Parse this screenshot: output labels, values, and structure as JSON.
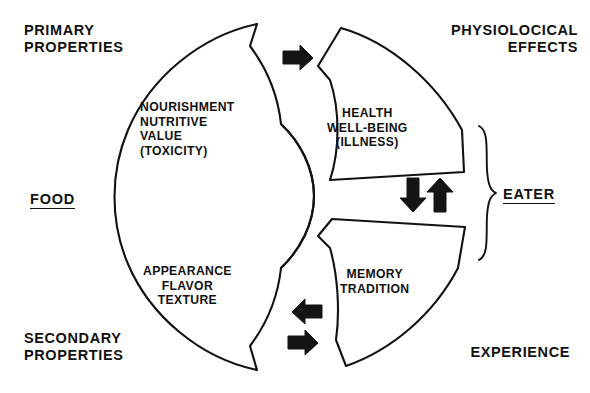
{
  "diagram": {
    "ink_color": "#111111",
    "background": "#ffffff",
    "corner_labels": {
      "top_left": "PRIMARY\nPROPERTIES",
      "top_right": "PHYSIOLOCICAL\nEFFECTS",
      "bottom_left": "SECONDARY\nPROPERTIES",
      "bottom_right": "EXPERIENCE"
    },
    "role_labels": {
      "left": "FOOD",
      "right": "EATER"
    },
    "sectors": [
      {
        "id": "primary-properties-sector",
        "side": "left",
        "position": "upper",
        "text": "NOURISHMENT\nNUTRITIVE\nVALUE\n(TOXICITY)",
        "belongs_to": "FOOD"
      },
      {
        "id": "secondary-properties-sector",
        "side": "left",
        "position": "lower",
        "text": "APPEARANCE\nFLAVOR\nTEXTURE",
        "belongs_to": "FOOD"
      },
      {
        "id": "physiological-effects-sector",
        "side": "right",
        "position": "upper",
        "text": "HEALTH\nWELL-BEING\n(ILLNESS)",
        "belongs_to": "EATER"
      },
      {
        "id": "experience-sector",
        "side": "right",
        "position": "lower",
        "text": "MEMORY\nTRADITION",
        "belongs_to": "EATER"
      }
    ],
    "arrows": [
      {
        "id": "arrow-top",
        "direction": "right",
        "from": "primary-properties",
        "to": "physiological-effects"
      },
      {
        "id": "arrow-middle-down",
        "direction": "down",
        "from": "physiological-effects",
        "to": "experience"
      },
      {
        "id": "arrow-middle-up",
        "direction": "up",
        "from": "experience",
        "to": "physiological-effects"
      },
      {
        "id": "arrow-bottom-left",
        "direction": "left",
        "from": "experience",
        "to": "secondary-properties"
      },
      {
        "id": "arrow-bottom-right",
        "direction": "right",
        "from": "secondary-properties",
        "to": "experience"
      }
    ],
    "brace": {
      "id": "eater-brace",
      "orientation": "right-facing",
      "groups": [
        "physiological-effects-sector",
        "experience-sector"
      ],
      "label": "EATER"
    }
  }
}
